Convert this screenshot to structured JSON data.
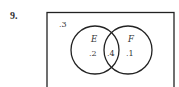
{
  "problem": {
    "number": "9."
  },
  "venn": {
    "outside": ".3",
    "sets": [
      {
        "label": "E",
        "only_value": ".2"
      },
      {
        "label": "F",
        "only_value": ".1"
      }
    ],
    "intersection": ".4"
  }
}
